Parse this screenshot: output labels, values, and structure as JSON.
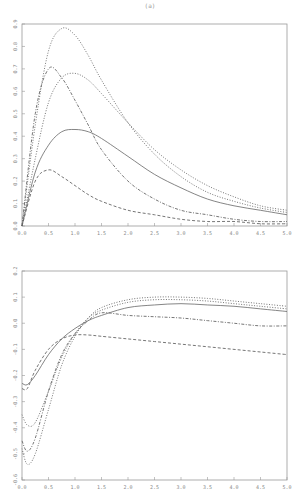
{
  "page": {
    "number": "(a)"
  },
  "chart_data": [
    {
      "type": "line",
      "title": "",
      "xlabel": "",
      "ylabel": "",
      "xlim": [
        0,
        5
      ],
      "ylim": [
        0,
        0.9
      ],
      "xticks": [
        "0.0",
        "0.5",
        "1.0",
        "1.5",
        "2.0",
        "2.5",
        "3.0",
        "3.5",
        "4.0",
        "4.5",
        "5.0"
      ],
      "yticks": [
        "0.0",
        "0.1",
        "0.2",
        "0.3",
        "0.4",
        "0.5",
        "0.6",
        "0.7",
        "0.8",
        "0.9"
      ],
      "grid": false,
      "legend": null,
      "x": [
        0,
        0.25,
        0.5,
        0.75,
        1.0,
        1.25,
        1.5,
        2.0,
        2.5,
        3.0,
        3.5,
        4.0,
        4.5,
        5.0
      ],
      "series": [
        {
          "name": "solid",
          "style": "solid",
          "values": [
            0,
            0.24,
            0.36,
            0.42,
            0.43,
            0.42,
            0.39,
            0.31,
            0.23,
            0.17,
            0.12,
            0.09,
            0.07,
            0.05
          ]
        },
        {
          "name": "dotted-tall",
          "style": "dotted",
          "values": [
            0,
            0.45,
            0.78,
            0.88,
            0.85,
            0.76,
            0.65,
            0.46,
            0.32,
            0.22,
            0.15,
            0.11,
            0.08,
            0.06
          ]
        },
        {
          "name": "dash-dot",
          "style": "dashdot",
          "values": [
            0,
            0.5,
            0.7,
            0.66,
            0.56,
            0.45,
            0.34,
            0.2,
            0.12,
            0.07,
            0.05,
            0.03,
            0.02,
            0.02
          ]
        },
        {
          "name": "dotted-medium",
          "style": "dotted",
          "values": [
            0,
            0.3,
            0.55,
            0.66,
            0.68,
            0.65,
            0.59,
            0.46,
            0.34,
            0.25,
            0.18,
            0.13,
            0.09,
            0.07
          ]
        },
        {
          "name": "dashed-low",
          "style": "dashed",
          "values": [
            0,
            0.2,
            0.25,
            0.22,
            0.18,
            0.14,
            0.11,
            0.07,
            0.05,
            0.03,
            0.02,
            0.02,
            0.01,
            0.01
          ]
        }
      ]
    },
    {
      "type": "line",
      "title": "",
      "xlabel": "",
      "ylabel": "",
      "xlim": [
        0,
        5
      ],
      "ylim": [
        -0.6,
        0.2
      ],
      "xticks": [
        "0.0",
        "0.5",
        "1.0",
        "1.5",
        "2.0",
        "2.5",
        "3.0",
        "3.5",
        "4.0",
        "4.5",
        "5.0"
      ],
      "yticks": [
        "-0.6",
        "-0.5",
        "-0.4",
        "-0.3",
        "-0.2",
        "-0.1",
        "0.0",
        "0.1",
        "0.2"
      ],
      "grid": false,
      "legend": null,
      "x": [
        0,
        0.1,
        0.25,
        0.5,
        0.75,
        1.0,
        1.25,
        1.5,
        2.0,
        2.5,
        3.0,
        3.5,
        4.0,
        4.5,
        5.0
      ],
      "series": [
        {
          "name": "solid",
          "style": "solid",
          "values": [
            -0.23,
            -0.235,
            -0.2,
            -0.12,
            -0.06,
            -0.02,
            0.01,
            0.03,
            0.06,
            0.07,
            0.075,
            0.07,
            0.065,
            0.055,
            0.045
          ]
        },
        {
          "name": "dotted-tall",
          "style": "dotted",
          "values": [
            -0.48,
            -0.54,
            -0.5,
            -0.33,
            -0.16,
            -0.05,
            0.02,
            0.06,
            0.09,
            0.1,
            0.1,
            0.095,
            0.085,
            0.075,
            0.065
          ]
        },
        {
          "name": "dash-dot",
          "style": "dashdot",
          "values": [
            -0.45,
            -0.49,
            -0.44,
            -0.26,
            -0.12,
            -0.04,
            0.01,
            0.04,
            0.03,
            0.025,
            0.02,
            0.01,
            0.0,
            -0.01,
            -0.01
          ]
        },
        {
          "name": "dotted-medium",
          "style": "dotted",
          "values": [
            -0.35,
            -0.39,
            -0.38,
            -0.26,
            -0.13,
            -0.04,
            0.02,
            0.05,
            0.08,
            0.09,
            0.09,
            0.085,
            0.075,
            0.065,
            0.055
          ]
        },
        {
          "name": "dashed-low",
          "style": "dashed",
          "values": [
            -0.25,
            -0.25,
            -0.18,
            -0.1,
            -0.06,
            -0.045,
            -0.045,
            -0.05,
            -0.06,
            -0.07,
            -0.08,
            -0.09,
            -0.1,
            -0.11,
            -0.12
          ]
        }
      ]
    }
  ]
}
